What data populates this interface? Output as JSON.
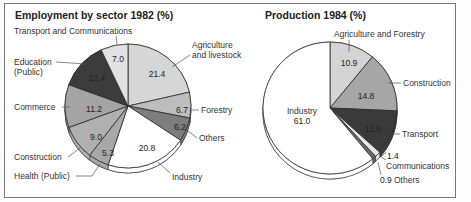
{
  "chart_data": [
    {
      "type": "pie",
      "title": "Employment by sector 1982 (%)",
      "slices": [
        {
          "label": "Agriculture and livestock",
          "value": 21.4,
          "color": "#d6d6d6"
        },
        {
          "label": "Forestry",
          "value": 6.7,
          "color": "#bdbdbd"
        },
        {
          "label": "Others",
          "value": 6.2,
          "color": "#7d7d7d"
        },
        {
          "label": "Industry",
          "value": 20.8,
          "color": "#ffffff"
        },
        {
          "label": "Health (Public)",
          "value": 5.3,
          "color": "#a8a8a8"
        },
        {
          "label": "Construction",
          "value": 9.0,
          "color": "#b0b0b0"
        },
        {
          "label": "Commerce",
          "value": 11.2,
          "color": "#a4a4a4"
        },
        {
          "label": "Education (Public)",
          "value": 12.4,
          "color": "#3c3c3c"
        },
        {
          "label": "Transport and Communications",
          "value": 7.0,
          "color": "#e2e2e2"
        }
      ]
    },
    {
      "type": "pie",
      "title": "Production 1984 (%)",
      "slices": [
        {
          "label": "Agriculture and Forestry",
          "value": 10.9,
          "color": "#d4d4d4"
        },
        {
          "label": "Construction",
          "value": 14.8,
          "color": "#a6a6a6"
        },
        {
          "label": "Transport",
          "value": 11.0,
          "color": "#3a3a3a"
        },
        {
          "label": "Communications",
          "value": 1.4,
          "color": "#e6e6e6"
        },
        {
          "label": "Others",
          "value": 0.9,
          "color": "#6a6a6a"
        },
        {
          "label": "Industry",
          "value": 61.0,
          "color": "#ffffff"
        }
      ]
    }
  ],
  "left": {
    "title": "Employment by sector 1982 (%)",
    "labels": {
      "transport": "Transport and Communications",
      "education_1": "Education",
      "education_2": "(Public)",
      "agri_1": "Agriculture",
      "agri_2": "and livestock",
      "forestry": "Forestry",
      "others": "Others",
      "commerce": "Commerce",
      "construction": "Construction",
      "health": "Health (Public)",
      "industry": "Industry"
    },
    "values": {
      "transport": "7.0",
      "education": "12.4",
      "agri": "21.4",
      "forestry": "6.7",
      "others": "6.2",
      "commerce": "11.2",
      "construction": "9.0",
      "health": "5.3",
      "industry": "20.8"
    }
  },
  "right": {
    "title": "Production 1984 (%)",
    "labels": {
      "agri": "Agriculture and Forestry",
      "construction": "Construction",
      "industry": "Industry",
      "transport": "Transport",
      "communications": "Communications",
      "others": "Others"
    },
    "values": {
      "agri": "10.9",
      "construction": "14.8",
      "industry": "61.0",
      "transport": "11.0",
      "communications": "1.4",
      "others": "0.9"
    }
  }
}
